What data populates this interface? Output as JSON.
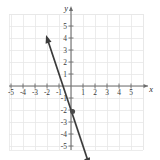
{
  "figure": {
    "title": "",
    "background_color": "#ffffff",
    "grid_color": "#e6e6e6",
    "axis_color": "#6e6e6e",
    "line_color": "#3b3b3b",
    "label_color": "#3a3a3a"
  },
  "axes": {
    "x_axis_label": "x",
    "y_axis_label": "y",
    "x_tick_labels": [
      "-5",
      "-4",
      "-3",
      "-2",
      "-1",
      "1",
      "2",
      "3",
      "4",
      "5"
    ],
    "y_tick_labels": [
      "5",
      "4",
      "3",
      "2",
      "1",
      "-1",
      "-2",
      "-3",
      "-4",
      "-5"
    ],
    "x_range": [
      -5.2,
      6.0
    ],
    "y_range": [
      -5.3,
      6.0
    ],
    "grid": true,
    "grid_step": 1
  },
  "chart_data": {
    "type": "line",
    "title": "",
    "xlabel": "x",
    "ylabel": "y",
    "xlim": [
      -5.2,
      6.0
    ],
    "ylim": [
      -5.3,
      6.0
    ],
    "grid": true,
    "legend": "none",
    "series": [
      {
        "name": "line",
        "kind": "linear",
        "slope": -3,
        "intercept": -2,
        "equation": "y = -3x - 2",
        "x_intercept": -0.667,
        "y_intercept": -2,
        "arrows": "both",
        "x": [
          -2.08,
          1.55
        ],
        "values": [
          4.24,
          -6.65
        ],
        "endpoints": [
          {
            "x": -2.08,
            "y": 4.24
          },
          {
            "x": 1.55,
            "y": -6.65
          }
        ]
      }
    ],
    "points": [
      {
        "label": "",
        "x": 0,
        "y": -2,
        "marker": "dot"
      }
    ],
    "x_ticks": [
      -5,
      -4,
      -3,
      -2,
      -1,
      1,
      2,
      3,
      4,
      5
    ],
    "y_ticks": [
      5,
      4,
      3,
      2,
      1,
      -1,
      -2,
      -3,
      -4,
      -5
    ]
  }
}
